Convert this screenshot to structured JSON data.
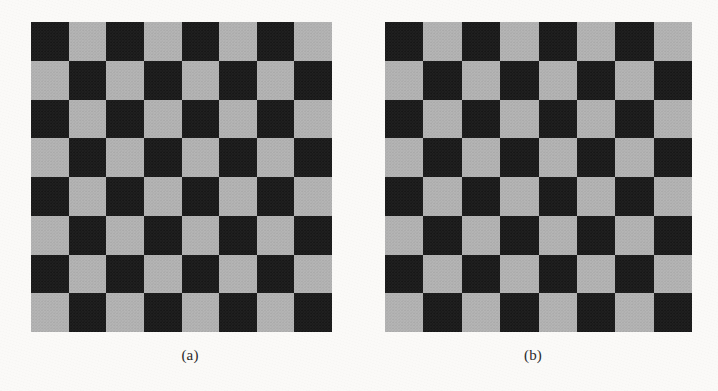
{
  "figure": {
    "background_color": "#fbfaf8",
    "panels": [
      {
        "id": "panel-a",
        "caption": "(a)",
        "board": {
          "rows": 8,
          "cols": 8,
          "top_left_color": "dark",
          "dark_color": "#1b1b1b",
          "light_color": "#b2b2b2",
          "x": 31,
          "y": 22,
          "width": 301,
          "height": 310
        },
        "caption_x": 190,
        "caption_y": 348
      },
      {
        "id": "panel-b",
        "caption": "(b)",
        "board": {
          "rows": 8,
          "cols": 8,
          "top_left_color": "dark",
          "dark_color": "#1b1b1b",
          "light_color": "#b2b2b2",
          "x": 385,
          "y": 22,
          "width": 307,
          "height": 310
        },
        "caption_x": 533,
        "caption_y": 348
      }
    ]
  },
  "chart_data": {
    "type": "heatmap",
    "title": "",
    "xlabel": "",
    "ylabel": "",
    "grid": false,
    "legend_position": "none",
    "value_legend": {
      "dark": 0,
      "light": 1
    },
    "panels": [
      {
        "label": "(a)",
        "rows": 8,
        "cols": 8,
        "matrix": [
          [
            0,
            1,
            0,
            1,
            0,
            1,
            0,
            1
          ],
          [
            1,
            0,
            1,
            0,
            1,
            0,
            1,
            0
          ],
          [
            0,
            1,
            0,
            1,
            0,
            1,
            0,
            1
          ],
          [
            1,
            0,
            1,
            0,
            1,
            0,
            1,
            0
          ],
          [
            0,
            1,
            0,
            1,
            0,
            1,
            0,
            1
          ],
          [
            1,
            0,
            1,
            0,
            1,
            0,
            1,
            0
          ],
          [
            0,
            1,
            0,
            1,
            0,
            1,
            0,
            1
          ],
          [
            1,
            0,
            1,
            0,
            1,
            0,
            1,
            0
          ]
        ]
      },
      {
        "label": "(b)",
        "rows": 8,
        "cols": 8,
        "matrix": [
          [
            0,
            1,
            0,
            1,
            0,
            1,
            0,
            1
          ],
          [
            1,
            0,
            1,
            0,
            1,
            0,
            1,
            0
          ],
          [
            0,
            1,
            0,
            1,
            0,
            1,
            0,
            1
          ],
          [
            1,
            0,
            1,
            0,
            1,
            0,
            1,
            0
          ],
          [
            0,
            1,
            0,
            1,
            0,
            1,
            0,
            1
          ],
          [
            1,
            0,
            1,
            0,
            1,
            0,
            1,
            0
          ],
          [
            0,
            1,
            0,
            1,
            0,
            1,
            0,
            1
          ],
          [
            1,
            0,
            1,
            0,
            1,
            0,
            1,
            0
          ]
        ]
      }
    ]
  }
}
